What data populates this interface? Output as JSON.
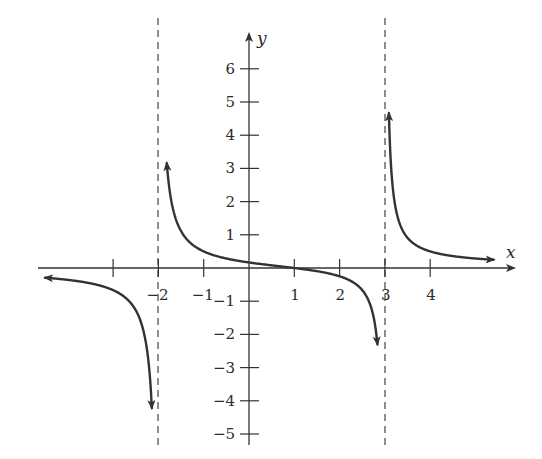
{
  "chart_data": {
    "type": "line",
    "title": "",
    "xlabel": "x",
    "ylabel": "y",
    "xlim": [
      -4.6,
      5.5
    ],
    "ylim": [
      -5.3,
      6.8
    ],
    "grid": false,
    "legend": null,
    "x_ticks": [
      -3,
      -2,
      -1,
      1,
      2,
      3,
      4
    ],
    "x_tick_labels": [
      "",
      "−2",
      "−1",
      "1",
      "2",
      "3",
      "4"
    ],
    "y_ticks": [
      -5,
      -4,
      -3,
      -2,
      -1,
      1,
      2,
      3,
      4,
      5,
      6
    ],
    "y_tick_labels": [
      "−5",
      "−4",
      "−3",
      "−2",
      "−1",
      "1",
      "2",
      "3",
      "4",
      "5",
      "6"
    ],
    "vertical_asymptotes": [
      -2,
      3
    ],
    "horizontal_asymptote": 0,
    "function_description": "Rational function f(x) = (x − 1) / ((x + 2)(x − 3)) with zero at x = 1, y-intercept ≈ 0.17",
    "series": [
      {
        "name": "left branch (x < -2)",
        "points": [
          [
            -4.5,
            -0.23
          ],
          [
            -4,
            -0.36
          ],
          [
            -3.5,
            -0.47
          ],
          [
            -3,
            -0.67
          ],
          [
            -2.6,
            -1.1
          ],
          [
            -2.4,
            -1.6
          ],
          [
            -2.25,
            -2.55
          ],
          [
            -2.15,
            -4.3
          ]
        ]
      },
      {
        "name": "middle branch (-2 < x < 3)",
        "points": [
          [
            -1.8,
            6.1
          ],
          [
            -1.7,
            4.0
          ],
          [
            -1.5,
            2.22
          ],
          [
            -1.2,
            1.15
          ],
          [
            -1,
            0.67
          ],
          [
            -0.5,
            0.34
          ],
          [
            0,
            0.17
          ],
          [
            0.5,
            0.08
          ],
          [
            1,
            0
          ],
          [
            1.5,
            -0.095
          ],
          [
            2,
            -0.25
          ],
          [
            2.4,
            -0.64
          ],
          [
            2.6,
            -1.19
          ],
          [
            2.75,
            -2.45
          ],
          [
            2.83,
            -3.98
          ]
        ]
      },
      {
        "name": "right branch (x > 3)",
        "points": [
          [
            3.1,
            6.4
          ],
          [
            3.2,
            4.5
          ],
          [
            3.4,
            2.33
          ],
          [
            3.7,
            1.13
          ],
          [
            4,
            0.5
          ],
          [
            4.5,
            0.35
          ],
          [
            5,
            0.29
          ],
          [
            5.3,
            0.26
          ]
        ]
      }
    ]
  }
}
